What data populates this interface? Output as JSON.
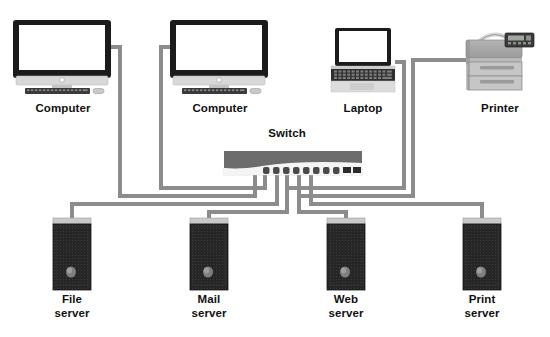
{
  "diagram": {
    "background_color": "#ffffff",
    "cable_color": "#8c8c8c",
    "label_color": "#111111",
    "switch": {
      "label": "Switch",
      "label_x": 262,
      "label_y": 128,
      "body_x": 224,
      "body_y": 151,
      "body_w": 138,
      "body_h": 24,
      "top_color": "#6e6e6e",
      "face_color": "#efefef",
      "port_color": "#4a4a4a",
      "round_port_count": 8,
      "rect_port_count": 2
    },
    "top_devices": [
      {
        "name": "computer-left",
        "icon": "desktop-computer-icon",
        "label": "Computer",
        "label_x": 16,
        "label_y": 103,
        "label_w": 94,
        "x": 13,
        "y": 20,
        "w": 98,
        "h": 60,
        "bezel_color": "#1b1b1b",
        "screen_color": "#ffffff",
        "stand_color": "#cfcfcf"
      },
      {
        "name": "computer-middle",
        "icon": "desktop-computer-icon",
        "label": "Computer",
        "label_x": 173,
        "label_y": 103,
        "label_w": 94,
        "x": 170,
        "y": 20,
        "w": 98,
        "h": 60,
        "bezel_color": "#1b1b1b",
        "screen_color": "#ffffff",
        "stand_color": "#cfcfcf"
      },
      {
        "name": "laptop",
        "icon": "laptop-icon",
        "label": "Laptop",
        "label_x": 330,
        "label_y": 103,
        "label_w": 66,
        "x": 331,
        "y": 28,
        "w": 64,
        "h": 58,
        "bezel_color": "#1b1b1b",
        "screen_color": "#ffffff",
        "base_color": "#d9d9d9"
      },
      {
        "name": "printer",
        "icon": "printer-icon",
        "label": "Printer",
        "label_x": 462,
        "label_y": 103,
        "label_w": 76,
        "x": 466,
        "y": 28,
        "w": 68,
        "h": 62,
        "body_color": "#a8a8a8",
        "tray_color": "#c2c2c2",
        "panel_color": "#3a3a3a"
      }
    ],
    "servers": [
      {
        "name": "file-server",
        "icon": "server-tower-icon",
        "label": "File\nserver",
        "label_x": 35,
        "label_y": 292,
        "label_w": 84,
        "x": 53,
        "y": 218,
        "w": 38,
        "h": 72,
        "case_color": "#262626",
        "top_color": "#c9c9c9",
        "knob_color": "#8a8a8a"
      },
      {
        "name": "mail-server",
        "icon": "server-tower-icon",
        "label": "Mail\nserver",
        "label_x": 179,
        "label_y": 292,
        "label_w": 84,
        "x": 190,
        "y": 218,
        "w": 38,
        "h": 72,
        "case_color": "#262626",
        "top_color": "#c9c9c9",
        "knob_color": "#8a8a8a"
      },
      {
        "name": "web-server",
        "icon": "server-tower-icon",
        "label": "Web\nserver",
        "label_x": 316,
        "label_y": 292,
        "label_w": 84,
        "x": 327,
        "y": 218,
        "w": 38,
        "h": 72,
        "case_color": "#262626",
        "top_color": "#c9c9c9",
        "knob_color": "#8a8a8a"
      },
      {
        "name": "print-server",
        "icon": "server-tower-icon",
        "label": "Print\nserver",
        "label_x": 450,
        "label_y": 292,
        "label_w": 84,
        "x": 463,
        "y": 218,
        "w": 38,
        "h": 72,
        "case_color": "#262626",
        "top_color": "#c9c9c9",
        "knob_color": "#8a8a8a"
      }
    ],
    "connections": [
      {
        "name": "cable-computer-left-to-switch",
        "from": "computer-left",
        "to": "switch",
        "path": "M 111 47 L 120 47 L 120 196 L 255 196 L 255 175"
      },
      {
        "name": "cable-computer-middle-to-switch",
        "from": "computer-middle",
        "to": "switch",
        "path": "M 170 47 L 161 47 L 161 188 L 265 188 L 265 175"
      },
      {
        "name": "cable-laptop-to-switch",
        "from": "laptop",
        "to": "switch",
        "path": "M 395 62 L 404 62 L 404 188 L 287 188 L 287 175"
      },
      {
        "name": "cable-printer-to-switch",
        "from": "printer",
        "to": "switch",
        "path": "M 466 60 L 413 60 L 413 196 L 299 196 L 299 175"
      },
      {
        "name": "cable-switch-to-file-server",
        "from": "switch",
        "to": "file-server",
        "path": "M 277 175 L 277 204 L 72 204 L 72 218"
      },
      {
        "name": "cable-switch-to-mail-server",
        "from": "switch",
        "to": "mail-server",
        "path": "M 287 175 L 287 212 L 209 212 L 209 218"
      },
      {
        "name": "cable-switch-to-web-server",
        "from": "switch",
        "to": "web-server",
        "path": "M 299 175 L 299 212 L 346 212 L 346 218"
      },
      {
        "name": "cable-switch-to-print-server",
        "from": "switch",
        "to": "print-server",
        "path": "M 311 175 L 311 204 L 482 204 L 482 218"
      }
    ]
  }
}
